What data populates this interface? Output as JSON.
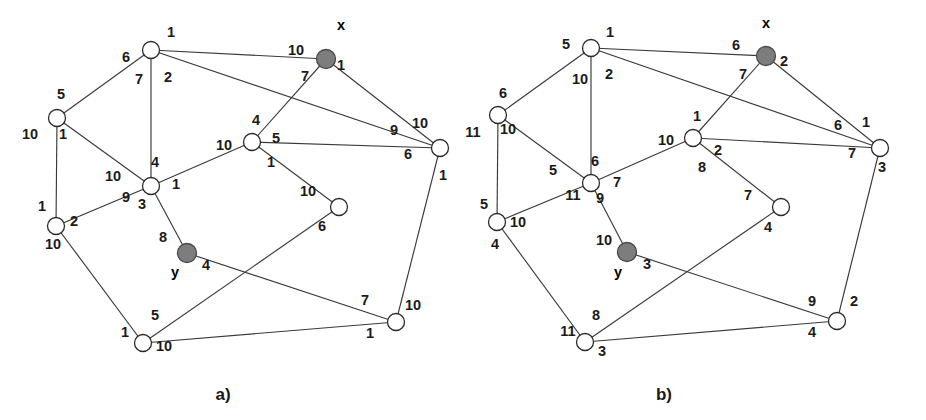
{
  "figure": {
    "background_color": "#ffffff",
    "edge_color": "#3a3a3a",
    "node_fill_color": "#ffffff",
    "node_stroke_color": "#2b2b2b",
    "highlight_fill_color": "#7d7d7d",
    "label_color": "#1a1a1a"
  },
  "panels": [
    {
      "id": "a",
      "caption": "a)",
      "caption_x": 223,
      "caption_y": 400,
      "nodes": [
        {
          "id": "a-n1",
          "x": 151,
          "y": 50,
          "r": 8.5,
          "highlight": false,
          "tag": ""
        },
        {
          "id": "a-n2",
          "x": 57,
          "y": 118,
          "r": 8.5,
          "highlight": false,
          "tag": ""
        },
        {
          "id": "a-x",
          "x": 326,
          "y": 59,
          "r": 9.5,
          "highlight": true,
          "tag": "x",
          "tag_x": 341,
          "tag_y": 30
        },
        {
          "id": "a-n4",
          "x": 440,
          "y": 148,
          "r": 8.5,
          "highlight": false,
          "tag": ""
        },
        {
          "id": "a-n5",
          "x": 252,
          "y": 142,
          "r": 8.5,
          "highlight": false,
          "tag": ""
        },
        {
          "id": "a-n6",
          "x": 151,
          "y": 186,
          "r": 8.5,
          "highlight": false,
          "tag": ""
        },
        {
          "id": "a-n7",
          "x": 339,
          "y": 207,
          "r": 8.5,
          "highlight": false,
          "tag": ""
        },
        {
          "id": "a-n8",
          "x": 56,
          "y": 226,
          "r": 8.5,
          "highlight": false,
          "tag": ""
        },
        {
          "id": "a-y",
          "x": 187,
          "y": 253,
          "r": 9.5,
          "highlight": true,
          "tag": "y",
          "tag_x": 175,
          "tag_y": 277
        },
        {
          "id": "a-n10",
          "x": 143,
          "y": 343,
          "r": 8.5,
          "highlight": false,
          "tag": ""
        },
        {
          "id": "a-n11",
          "x": 396,
          "y": 322,
          "r": 8.5,
          "highlight": false,
          "tag": ""
        }
      ],
      "edges": [
        {
          "from": "a-n1",
          "to": "a-x"
        },
        {
          "from": "a-n1",
          "to": "a-n2"
        },
        {
          "from": "a-n1",
          "to": "a-n6"
        },
        {
          "from": "a-n1",
          "to": "a-n4"
        },
        {
          "from": "a-x",
          "to": "a-n5"
        },
        {
          "from": "a-x",
          "to": "a-n4"
        },
        {
          "from": "a-n2",
          "to": "a-n8"
        },
        {
          "from": "a-n2",
          "to": "a-n6"
        },
        {
          "from": "a-n5",
          "to": "a-n6"
        },
        {
          "from": "a-n5",
          "to": "a-n4"
        },
        {
          "from": "a-n5",
          "to": "a-n7"
        },
        {
          "from": "a-n6",
          "to": "a-n8"
        },
        {
          "from": "a-n6",
          "to": "a-y"
        },
        {
          "from": "a-n4",
          "to": "a-n11"
        },
        {
          "from": "a-n7",
          "to": "a-n10"
        },
        {
          "from": "a-n8",
          "to": "a-n10"
        },
        {
          "from": "a-y",
          "to": "a-n11"
        },
        {
          "from": "a-n10",
          "to": "a-n11"
        }
      ],
      "weights": [
        {
          "text": "1",
          "x": 171,
          "y": 37
        },
        {
          "text": "6",
          "x": 126,
          "y": 62
        },
        {
          "text": "7",
          "x": 139,
          "y": 84
        },
        {
          "text": "2",
          "x": 168,
          "y": 82
        },
        {
          "text": "5",
          "x": 61,
          "y": 99
        },
        {
          "text": "10",
          "x": 30,
          "y": 139
        },
        {
          "text": "1",
          "x": 63,
          "y": 139
        },
        {
          "text": "10",
          "x": 296,
          "y": 55
        },
        {
          "text": "1",
          "x": 341,
          "y": 70
        },
        {
          "text": "7",
          "x": 305,
          "y": 81
        },
        {
          "text": "4",
          "x": 256,
          "y": 125
        },
        {
          "text": "5",
          "x": 276,
          "y": 143
        },
        {
          "text": "10",
          "x": 224,
          "y": 150
        },
        {
          "text": "1",
          "x": 271,
          "y": 167
        },
        {
          "text": "9",
          "x": 394,
          "y": 135
        },
        {
          "text": "10",
          "x": 420,
          "y": 128
        },
        {
          "text": "6",
          "x": 408,
          "y": 159
        },
        {
          "text": "1",
          "x": 443,
          "y": 180
        },
        {
          "text": "4",
          "x": 155,
          "y": 167
        },
        {
          "text": "10",
          "x": 113,
          "y": 181
        },
        {
          "text": "1",
          "x": 176,
          "y": 189
        },
        {
          "text": "9",
          "x": 126,
          "y": 202
        },
        {
          "text": "3",
          "x": 142,
          "y": 209
        },
        {
          "text": "1",
          "x": 42,
          "y": 211
        },
        {
          "text": "2",
          "x": 74,
          "y": 226
        },
        {
          "text": "10",
          "x": 53,
          "y": 249
        },
        {
          "text": "10",
          "x": 308,
          "y": 196
        },
        {
          "text": "6",
          "x": 322,
          "y": 231
        },
        {
          "text": "8",
          "x": 163,
          "y": 242
        },
        {
          "text": "4",
          "x": 206,
          "y": 270
        },
        {
          "text": "5",
          "x": 155,
          "y": 320
        },
        {
          "text": "1",
          "x": 125,
          "y": 337
        },
        {
          "text": "10",
          "x": 164,
          "y": 351
        },
        {
          "text": "7",
          "x": 365,
          "y": 305
        },
        {
          "text": "10",
          "x": 413,
          "y": 310
        },
        {
          "text": "1",
          "x": 370,
          "y": 338
        }
      ]
    },
    {
      "id": "b",
      "caption": "b)",
      "caption_x": 664,
      "caption_y": 400,
      "nodes": [
        {
          "id": "b-n1",
          "x": 591,
          "y": 48,
          "r": 8.5,
          "highlight": false,
          "tag": ""
        },
        {
          "id": "b-n2",
          "x": 498,
          "y": 115,
          "r": 8.5,
          "highlight": false,
          "tag": ""
        },
        {
          "id": "b-x",
          "x": 766,
          "y": 56,
          "r": 9.5,
          "highlight": true,
          "tag": "x",
          "tag_x": 766,
          "tag_y": 28
        },
        {
          "id": "b-n4",
          "x": 880,
          "y": 148,
          "r": 8.5,
          "highlight": false,
          "tag": ""
        },
        {
          "id": "b-n5",
          "x": 693,
          "y": 138,
          "r": 8.5,
          "highlight": false,
          "tag": ""
        },
        {
          "id": "b-n6",
          "x": 591,
          "y": 183,
          "r": 8.5,
          "highlight": false,
          "tag": ""
        },
        {
          "id": "b-n7",
          "x": 781,
          "y": 207,
          "r": 8.5,
          "highlight": false,
          "tag": ""
        },
        {
          "id": "b-n8",
          "x": 497,
          "y": 222,
          "r": 8.5,
          "highlight": false,
          "tag": ""
        },
        {
          "id": "b-y",
          "x": 627,
          "y": 252,
          "r": 9.5,
          "highlight": true,
          "tag": "y",
          "tag_x": 618,
          "tag_y": 277
        },
        {
          "id": "b-n10",
          "x": 585,
          "y": 342,
          "r": 8.5,
          "highlight": false,
          "tag": ""
        },
        {
          "id": "b-n11",
          "x": 837,
          "y": 321,
          "r": 8.5,
          "highlight": false,
          "tag": ""
        }
      ],
      "edges": [
        {
          "from": "b-n1",
          "to": "b-x"
        },
        {
          "from": "b-n1",
          "to": "b-n2"
        },
        {
          "from": "b-n1",
          "to": "b-n6"
        },
        {
          "from": "b-n1",
          "to": "b-n4"
        },
        {
          "from": "b-x",
          "to": "b-n5"
        },
        {
          "from": "b-x",
          "to": "b-n4"
        },
        {
          "from": "b-n2",
          "to": "b-n8"
        },
        {
          "from": "b-n2",
          "to": "b-n6"
        },
        {
          "from": "b-n5",
          "to": "b-n6"
        },
        {
          "from": "b-n5",
          "to": "b-n4"
        },
        {
          "from": "b-n5",
          "to": "b-n7"
        },
        {
          "from": "b-n6",
          "to": "b-n8"
        },
        {
          "from": "b-n6",
          "to": "b-y"
        },
        {
          "from": "b-n4",
          "to": "b-n11"
        },
        {
          "from": "b-n7",
          "to": "b-n10"
        },
        {
          "from": "b-n8",
          "to": "b-n10"
        },
        {
          "from": "b-y",
          "to": "b-n11"
        },
        {
          "from": "b-n10",
          "to": "b-n11"
        }
      ],
      "weights": [
        {
          "text": "1",
          "x": 610,
          "y": 37
        },
        {
          "text": "5",
          "x": 566,
          "y": 49
        },
        {
          "text": "10",
          "x": 580,
          "y": 84
        },
        {
          "text": "2",
          "x": 609,
          "y": 79
        },
        {
          "text": "6",
          "x": 503,
          "y": 98
        },
        {
          "text": "11",
          "x": 473,
          "y": 137
        },
        {
          "text": "10",
          "x": 508,
          "y": 134
        },
        {
          "text": "6",
          "x": 736,
          "y": 50
        },
        {
          "text": "2",
          "x": 784,
          "y": 66
        },
        {
          "text": "7",
          "x": 743,
          "y": 79
        },
        {
          "text": "1",
          "x": 697,
          "y": 121
        },
        {
          "text": "10",
          "x": 666,
          "y": 145
        },
        {
          "text": "2",
          "x": 718,
          "y": 155
        },
        {
          "text": "8",
          "x": 702,
          "y": 172
        },
        {
          "text": "6",
          "x": 838,
          "y": 130
        },
        {
          "text": "1",
          "x": 866,
          "y": 127
        },
        {
          "text": "7",
          "x": 852,
          "y": 158
        },
        {
          "text": "3",
          "x": 882,
          "y": 172
        },
        {
          "text": "5",
          "x": 553,
          "y": 175
        },
        {
          "text": "6",
          "x": 595,
          "y": 166
        },
        {
          "text": "7",
          "x": 617,
          "y": 187
        },
        {
          "text": "11",
          "x": 573,
          "y": 200
        },
        {
          "text": "9",
          "x": 600,
          "y": 203
        },
        {
          "text": "5",
          "x": 484,
          "y": 209
        },
        {
          "text": "10",
          "x": 518,
          "y": 227
        },
        {
          "text": "4",
          "x": 495,
          "y": 249
        },
        {
          "text": "7",
          "x": 748,
          "y": 200
        },
        {
          "text": "4",
          "x": 768,
          "y": 232
        },
        {
          "text": "10",
          "x": 604,
          "y": 245
        },
        {
          "text": "3",
          "x": 647,
          "y": 269
        },
        {
          "text": "8",
          "x": 596,
          "y": 320
        },
        {
          "text": "11",
          "x": 568,
          "y": 336
        },
        {
          "text": "3",
          "x": 602,
          "y": 356
        },
        {
          "text": "9",
          "x": 812,
          "y": 306
        },
        {
          "text": "2",
          "x": 854,
          "y": 306
        },
        {
          "text": "4",
          "x": 812,
          "y": 337
        }
      ]
    }
  ]
}
